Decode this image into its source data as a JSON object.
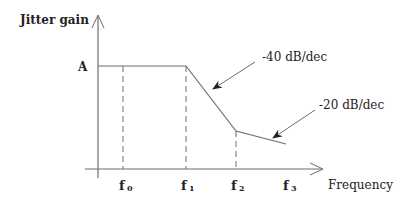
{
  "diagram": {
    "y_axis_label": "Jitter gain",
    "x_axis_label": "Frequency",
    "level_label": "A",
    "frequency_ticks": [
      {
        "base": "f",
        "sub": "0"
      },
      {
        "base": "f",
        "sub": "1"
      },
      {
        "base": "f",
        "sub": "2"
      },
      {
        "base": "f",
        "sub": "3"
      }
    ],
    "annotations": [
      {
        "text": "-40 dB/dec",
        "points_to": "segment f1-f2"
      },
      {
        "text": "-20 dB/dec",
        "points_to": "segment after f2"
      }
    ],
    "colors": {
      "line": "#6e6e6e",
      "text": "#222222",
      "background": "#ffffff"
    }
  }
}
